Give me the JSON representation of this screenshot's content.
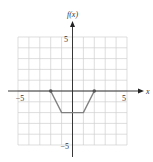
{
  "chart_data": {
    "type": "line",
    "title": "",
    "xlabel": "x",
    "ylabel": "f(x)",
    "xlim": [
      -5,
      5
    ],
    "ylim": [
      -5,
      5
    ],
    "grid": true,
    "tick_labels": {
      "x_min": "−5",
      "x_max": "5",
      "y_min": "−5",
      "y_max": "5"
    },
    "series": [
      {
        "name": "f(x)",
        "x": [
          -2,
          -1,
          1,
          2
        ],
        "y": [
          0,
          -2,
          -2,
          0
        ],
        "color": "#808080"
      }
    ],
    "endpoints": [
      {
        "x": -2,
        "y": 0
      },
      {
        "x": 2,
        "y": 0
      }
    ]
  },
  "labels": {
    "y_axis": "f(x)",
    "x_axis": "x",
    "x_min": "−5",
    "x_max": "5",
    "y_min": "−5",
    "y_max": "5"
  }
}
